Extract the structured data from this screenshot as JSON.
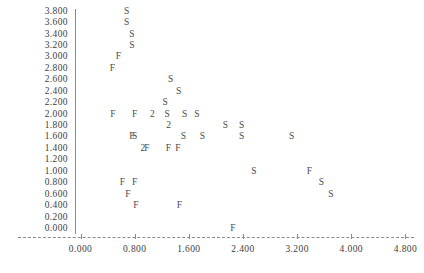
{
  "chart_data": {
    "type": "scatter",
    "title": "",
    "subtitle": "",
    "xlabel": "",
    "ylabel": "",
    "xlim": [
      0.0,
      4.8
    ],
    "ylim": [
      0.0,
      3.8
    ],
    "grid": false,
    "legend_position": "none",
    "marker_style": "character",
    "x_ticks": [
      "0.000",
      "0.800",
      "1.600",
      "2.400",
      "3.200",
      "4.000",
      "4.800"
    ],
    "x_tick_values": [
      0.0,
      0.8,
      1.6,
      2.4,
      3.2,
      4.0,
      4.8
    ],
    "y_ticks": [
      "3.800",
      "3.600",
      "3.400",
      "3.200",
      "3.000",
      "2.800",
      "2.600",
      "2.400",
      "2.200",
      "2.000",
      "1.800",
      "1.600",
      "1.400",
      "1.200",
      "1.000",
      "0.800",
      "0.600",
      "0.400",
      "0.200",
      "0.000"
    ],
    "y_tick_values": [
      3.8,
      3.6,
      3.4,
      3.2,
      3.0,
      2.8,
      2.6,
      2.4,
      2.2,
      2.0,
      1.8,
      1.6,
      1.4,
      1.2,
      1.0,
      0.8,
      0.6,
      0.4,
      0.2,
      0.0
    ],
    "series": [
      {
        "name": "S",
        "symbol": "S",
        "points": [
          {
            "x": 0.68,
            "y": 3.8
          },
          {
            "x": 0.68,
            "y": 3.6
          },
          {
            "x": 0.76,
            "y": 3.4
          },
          {
            "x": 0.76,
            "y": 3.2
          },
          {
            "x": 1.33,
            "y": 2.6
          },
          {
            "x": 1.45,
            "y": 2.4
          },
          {
            "x": 1.25,
            "y": 2.2
          },
          {
            "x": 1.28,
            "y": 2.0
          },
          {
            "x": 1.54,
            "y": 2.0
          },
          {
            "x": 1.72,
            "y": 2.0
          },
          {
            "x": 2.14,
            "y": 1.8
          },
          {
            "x": 2.38,
            "y": 1.8
          },
          {
            "x": 0.8,
            "y": 1.6
          },
          {
            "x": 1.52,
            "y": 1.6
          },
          {
            "x": 1.8,
            "y": 1.6
          },
          {
            "x": 2.38,
            "y": 1.6
          },
          {
            "x": 3.12,
            "y": 1.6
          },
          {
            "x": 2.56,
            "y": 1.0
          },
          {
            "x": 3.56,
            "y": 0.8
          },
          {
            "x": 3.7,
            "y": 0.6
          }
        ]
      },
      {
        "name": "F",
        "symbol": "F",
        "points": [
          {
            "x": 0.56,
            "y": 3.0
          },
          {
            "x": 0.47,
            "y": 2.8
          },
          {
            "x": 0.48,
            "y": 2.0
          },
          {
            "x": 0.8,
            "y": 2.0
          },
          {
            "x": 0.76,
            "y": 1.6
          },
          {
            "x": 0.98,
            "y": 1.4
          },
          {
            "x": 1.3,
            "y": 1.4
          },
          {
            "x": 1.44,
            "y": 1.4
          },
          {
            "x": 3.38,
            "y": 1.0
          },
          {
            "x": 0.62,
            "y": 0.8
          },
          {
            "x": 0.8,
            "y": 0.8
          },
          {
            "x": 0.7,
            "y": 0.6
          },
          {
            "x": 0.82,
            "y": 0.4
          },
          {
            "x": 1.46,
            "y": 0.4
          },
          {
            "x": 2.25,
            "y": 0.0
          }
        ]
      },
      {
        "name": "2",
        "symbol": "2",
        "overlap_count": 2,
        "points": [
          {
            "x": 1.06,
            "y": 2.0
          },
          {
            "x": 1.3,
            "y": 1.8
          },
          {
            "x": 0.92,
            "y": 1.4
          }
        ]
      }
    ]
  }
}
